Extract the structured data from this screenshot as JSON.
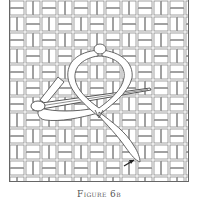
{
  "figure": {
    "caption": "Figure 6b",
    "illustration": {
      "subject": "ribbon-embroidery-stitch",
      "elements": [
        "canvas-weave-grid",
        "ribbon-loop",
        "needle",
        "ribbon-tail",
        "direction-arrow"
      ]
    }
  },
  "colors": {
    "line": "#555555",
    "fill": "#ffffff",
    "grid": "#8a8a8a"
  }
}
